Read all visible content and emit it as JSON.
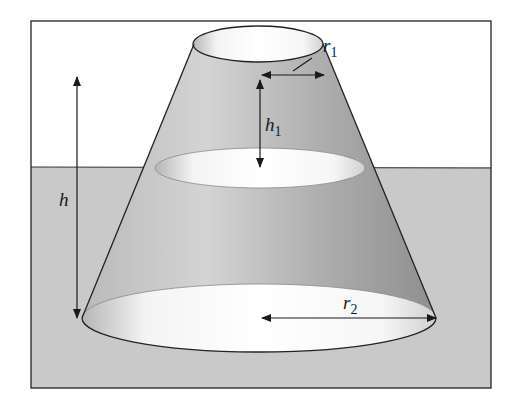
{
  "figure": {
    "colors": {
      "background": "#ffffff",
      "ground": "#c9c9c9",
      "frustum_light": "#d6d6d6",
      "frustum_dark": "#9c9c9c",
      "outline": "#222222",
      "ellipse_interior": "#ffffff"
    },
    "labels": {
      "r1": {
        "main": "r",
        "sub": "1"
      },
      "h1": {
        "main": "h",
        "sub": "1"
      },
      "h": {
        "main": "h"
      },
      "r2": {
        "main": "r",
        "sub": "2"
      }
    }
  }
}
